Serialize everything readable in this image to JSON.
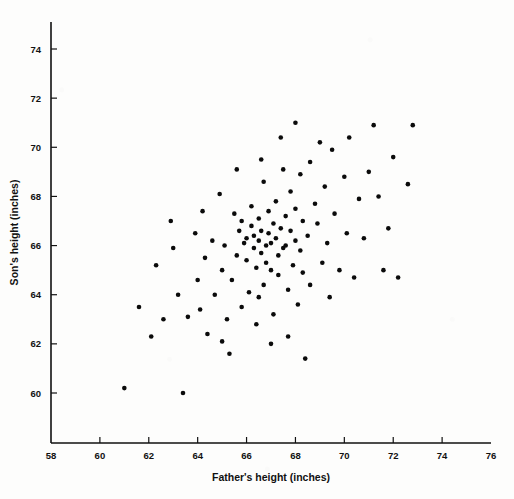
{
  "chart_data": {
    "type": "scatter",
    "title": "",
    "xlabel": "Father's height (inches)",
    "ylabel": "Son's height (inches)",
    "xlim": [
      58,
      76
    ],
    "ylim": [
      58.6,
      75.2
    ],
    "xticks": [
      58,
      60,
      62,
      64,
      66,
      68,
      70,
      72,
      74,
      76
    ],
    "yticks": [
      60,
      62,
      64,
      66,
      68,
      70,
      72,
      74
    ],
    "xtick_labels": [
      "58",
      "60",
      "62",
      "64",
      "66",
      "68",
      "70",
      "72",
      "74",
      "76"
    ],
    "ytick_labels": [
      "60",
      "62",
      "64",
      "66",
      "68",
      "70",
      "72",
      "74"
    ],
    "grid": false,
    "legend": null,
    "marker": "filled-circle",
    "marker_color": "#0b0b0b",
    "marker_size_px": 4.6,
    "n_points": 110,
    "points": [
      [
        61.0,
        60.2
      ],
      [
        63.4,
        60.0
      ],
      [
        62.1,
        62.3
      ],
      [
        61.6,
        63.5
      ],
      [
        62.6,
        63.0
      ],
      [
        62.3,
        65.2
      ],
      [
        63.2,
        64.0
      ],
      [
        63.6,
        63.1
      ],
      [
        64.0,
        64.6
      ],
      [
        64.1,
        63.4
      ],
      [
        64.7,
        64.0
      ],
      [
        64.3,
        65.5
      ],
      [
        64.6,
        66.2
      ],
      [
        64.9,
        68.1
      ],
      [
        65.0,
        65.0
      ],
      [
        65.1,
        66.0
      ],
      [
        65.2,
        63.0
      ],
      [
        65.3,
        61.6
      ],
      [
        65.4,
        64.6
      ],
      [
        65.5,
        67.3
      ],
      [
        65.6,
        65.6
      ],
      [
        65.7,
        66.6
      ],
      [
        65.8,
        67.0
      ],
      [
        65.9,
        66.1
      ],
      [
        66.0,
        66.3
      ],
      [
        66.0,
        65.4
      ],
      [
        66.1,
        64.1
      ],
      [
        66.2,
        67.6
      ],
      [
        66.2,
        66.8
      ],
      [
        66.3,
        65.9
      ],
      [
        66.3,
        66.4
      ],
      [
        66.4,
        65.1
      ],
      [
        66.4,
        62.8
      ],
      [
        66.5,
        66.2
      ],
      [
        66.5,
        67.1
      ],
      [
        66.6,
        65.7
      ],
      [
        66.6,
        66.6
      ],
      [
        66.7,
        64.4
      ],
      [
        66.7,
        68.6
      ],
      [
        66.8,
        66.0
      ],
      [
        66.8,
        65.3
      ],
      [
        66.9,
        66.5
      ],
      [
        66.9,
        67.4
      ],
      [
        67.0,
        66.1
      ],
      [
        67.0,
        65.0
      ],
      [
        67.1,
        66.9
      ],
      [
        67.1,
        63.2
      ],
      [
        67.2,
        67.8
      ],
      [
        67.2,
        66.3
      ],
      [
        67.3,
        65.6
      ],
      [
        67.3,
        64.8
      ],
      [
        67.4,
        66.7
      ],
      [
        67.5,
        69.1
      ],
      [
        67.5,
        65.9
      ],
      [
        67.6,
        67.2
      ],
      [
        67.6,
        66.0
      ],
      [
        67.7,
        64.2
      ],
      [
        67.8,
        68.2
      ],
      [
        67.8,
        66.6
      ],
      [
        67.9,
        65.2
      ],
      [
        68.0,
        71.0
      ],
      [
        68.0,
        67.5
      ],
      [
        68.0,
        66.2
      ],
      [
        68.1,
        63.6
      ],
      [
        68.2,
        68.9
      ],
      [
        68.2,
        65.8
      ],
      [
        68.3,
        67.0
      ],
      [
        68.4,
        61.4
      ],
      [
        68.5,
        66.4
      ],
      [
        68.6,
        69.4
      ],
      [
        68.6,
        64.4
      ],
      [
        68.8,
        67.7
      ],
      [
        68.9,
        66.9
      ],
      [
        69.0,
        70.2
      ],
      [
        69.1,
        65.3
      ],
      [
        69.2,
        68.4
      ],
      [
        69.3,
        66.1
      ],
      [
        69.4,
        63.9
      ],
      [
        69.5,
        69.9
      ],
      [
        69.6,
        67.3
      ],
      [
        69.8,
        65.0
      ],
      [
        70.0,
        68.8
      ],
      [
        70.1,
        66.5
      ],
      [
        70.2,
        70.4
      ],
      [
        70.4,
        64.7
      ],
      [
        70.6,
        67.9
      ],
      [
        70.8,
        66.3
      ],
      [
        71.0,
        69.0
      ],
      [
        71.2,
        70.9
      ],
      [
        71.4,
        68.0
      ],
      [
        71.6,
        65.0
      ],
      [
        71.8,
        66.7
      ],
      [
        72.0,
        69.6
      ],
      [
        72.2,
        64.7
      ],
      [
        72.6,
        68.5
      ],
      [
        72.8,
        70.9
      ],
      [
        63.9,
        66.5
      ],
      [
        64.4,
        62.4
      ],
      [
        65.0,
        62.1
      ],
      [
        65.8,
        63.5
      ],
      [
        66.5,
        63.9
      ],
      [
        67.0,
        62.0
      ],
      [
        67.7,
        62.3
      ],
      [
        68.3,
        64.9
      ],
      [
        63.0,
        65.9
      ],
      [
        62.9,
        67.0
      ],
      [
        64.2,
        67.4
      ],
      [
        65.6,
        69.1
      ],
      [
        66.6,
        69.5
      ],
      [
        67.4,
        70.4
      ]
    ]
  },
  "axes": {
    "x_title": "Father's height (inches)",
    "y_title": "Son's height (inches)"
  }
}
